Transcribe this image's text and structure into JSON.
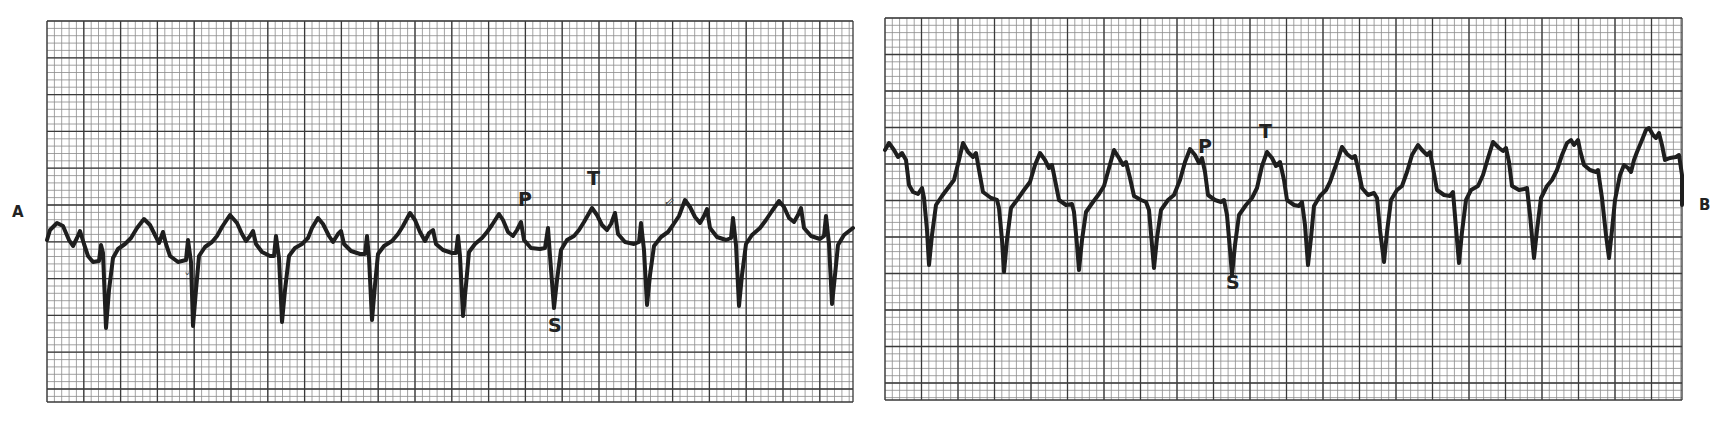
{
  "figure": {
    "panels": [
      {
        "id": "A",
        "label": "A",
        "grid": {
          "x": 47,
          "y": 21,
          "width": 806,
          "height": 381,
          "major": 36.8,
          "minor": 7.36
        },
        "wave_labels": {
          "P": "P",
          "T": "T",
          "S": "S"
        },
        "trace": "M47,240 L50,230 L57,223 L63,226 L69,240 L73,246 L77,238 L80,231 L84,244 L88,256 L93,262 L99,261 L101,245 L103,253 L106,328 L109,290 L113,258 L118,249 L125,244 L131,238 L137,228 L144,219 L150,225 L155,235 L159,243 L163,232 L166,244 L170,256 L178,262 L186,260 L188,240 L191,262 L193,326 L196,290 L199,256 L205,247 L212,242 L217,236 L222,227 L230,215 L237,223 L242,234 L246,241 L250,236 L253,231 L256,244 L262,252 L270,256 L274,256 L276,236 L279,258 L282,322 L285,290 L289,256 L295,248 L302,244 L308,238 L312,228 L318,218 L323,224 L329,236 L333,242 L338,234 L341,231 L344,244 L351,251 L360,254 L365,254 L367,236 L369,258 L372,320 L375,285 L378,254 L384,246 L392,241 L398,234 L403,226 L410,213 L415,220 L420,232 L425,241 L429,233 L433,230 L436,244 L443,250 L452,253 L456,253 L458,236 L460,256 L463,316 L466,285 L469,252 L475,244 L482,238 L487,232 L492,225 L499,214 L503,220 L508,232 L513,236 L517,230 L521,222 L524,240 L531,248 L540,249 L545,248 L548,228 L550,256 L554,308 L557,280 L561,250 L567,240 L574,236 L579,230 L584,222 L592,208 L597,215 L602,225 L607,230 L611,224 L615,213 L618,234 L625,242 L634,244 L639,242 L641,223 L644,250 L647,305 L650,275 L654,246 L661,237 L668,232 L673,225 L679,216 L685,200 L690,207 L695,217 L700,223 L704,216 L707,209 L710,228 L717,237 L726,240 L731,238 L733,218 L736,245 L739,306 L742,275 L746,244 L752,235 L760,228 L766,220 L772,211 L779,201 L784,207 L789,218 L794,222 L798,215 L801,208 L804,228 L811,236 L820,239 L824,236 L826,216 L829,244 L832,304 L835,275 L838,245 L844,235 L853,228"
      },
      {
        "id": "B",
        "label": "B",
        "grid": {
          "x": 885,
          "y": 18,
          "width": 797,
          "height": 382,
          "major": 36.5,
          "minor": 7.3
        },
        "wave_labels": {
          "P": "P",
          "T": "T",
          "S": "S"
        },
        "trace": "M885,150 L889,143 L894,150 L898,157 L902,153 L906,160 L909,185 L913,192 L918,194 L922,188 L924,198 L927,230 L929,265 L932,235 L936,205 L942,196 L948,188 L954,180 L959,160 L963,143 L968,152 L973,157 L976,153 L979,170 L983,192 L991,198 L997,200 L999,208 L1002,240 L1004,272 L1007,240 L1011,208 L1017,200 L1024,190 L1030,182 L1035,165 L1040,153 L1045,160 L1049,168 L1052,165 L1055,180 L1059,200 L1066,205 L1072,204 L1074,212 L1077,245 L1079,270 L1082,240 L1086,212 L1093,202 L1099,194 L1104,186 L1109,168 L1114,150 L1119,158 L1123,165 L1126,162 L1130,178 L1134,196 L1141,200 L1146,202 L1149,210 L1152,245 L1154,268 L1157,238 L1161,210 L1168,200 L1174,195 L1180,180 L1185,162 L1190,149 L1195,155 L1199,163 L1202,158 L1205,172 L1208,195 L1215,200 L1221,202 L1224,200 L1227,215 L1230,250 L1232,275 L1235,245 L1239,215 L1246,205 L1252,198 L1257,188 L1262,166 L1267,152 L1272,158 L1276,166 L1280,162 L1284,180 L1287,200 L1294,205 L1299,206 L1302,202 L1305,225 L1308,265 L1311,238 L1314,206 L1320,196 L1326,190 L1330,182 L1336,165 L1342,147 L1347,154 L1352,158 L1355,156 L1358,168 L1362,188 L1368,195 L1374,193 L1377,198 L1380,230 L1384,262 L1387,232 L1391,200 L1397,190 L1402,186 L1407,172 L1412,155 L1418,145 L1422,150 L1427,155 L1430,152 L1433,168 L1437,190 L1444,195 L1450,196 L1453,192 L1456,228 L1459,263 L1462,232 L1466,200 L1471,190 L1478,186 L1483,175 L1488,158 L1493,142 L1499,148 L1503,151 L1506,148 L1509,162 L1512,186 L1519,190 L1524,189 L1527,188 L1530,215 L1534,258 L1537,230 L1541,198 L1547,186 L1552,180 L1557,170 L1562,155 L1567,143 L1571,140 L1574,145 L1578,140 L1580,150 L1584,165 L1590,170 L1596,172 L1598,170 L1602,198 L1606,235 L1609,258 L1612,230 L1615,200 L1620,175 L1624,165 L1628,168 L1631,172 L1634,160 L1637,152 L1642,140 L1646,130 L1649,128 L1653,135 L1656,138 L1659,133 L1662,145 L1665,160 L1670,158 L1676,157 L1679,155 L1682,175 L1682,205"
      }
    ],
    "annotations": [
      {
        "panel": "A",
        "text": "P",
        "x": 518,
        "y": 190
      },
      {
        "panel": "A",
        "text": "T",
        "x": 587,
        "y": 169
      },
      {
        "panel": "A",
        "text": "S",
        "x": 548,
        "y": 316
      },
      {
        "panel": "B",
        "text": "P",
        "x": 1198,
        "y": 137
      },
      {
        "panel": "B",
        "text": "T",
        "x": 1259,
        "y": 122
      },
      {
        "panel": "B",
        "text": "S",
        "x": 1226,
        "y": 273
      }
    ],
    "arrows": [
      {
        "panel": "A",
        "glyph": "⇙",
        "x": 664,
        "y": 195
      },
      {
        "panel": "A",
        "glyph": "ˇ",
        "x": 184,
        "y": 272
      }
    ],
    "colors": {
      "grid_major": "#3a3a3a",
      "grid_minor": "#8a8a8a",
      "trace": "#1e1e1e",
      "paper": "#ffffff"
    }
  }
}
